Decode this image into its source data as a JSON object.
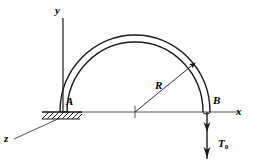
{
  "figure": {
    "background_color": "#ffffff",
    "line_color": "#1a1a1a",
    "width": 253,
    "height": 162
  },
  "axes": {
    "y_label": "y",
    "x_label": "x",
    "z_label": "z",
    "origin": {
      "x": 63,
      "y": 112
    }
  },
  "points": {
    "fixed_end_label": "A",
    "free_end_label": "B"
  },
  "dimensions": {
    "radius_label": "R",
    "radius_pixels": 72,
    "center": {
      "x": 135,
      "y": 112
    }
  },
  "loads": {
    "torque_label": "T",
    "torque_subscript": "0",
    "torque_direction": "downward",
    "arrowheads": 2
  },
  "support": {
    "type": "fixed-support-hatching",
    "hatch_count": 9
  }
}
